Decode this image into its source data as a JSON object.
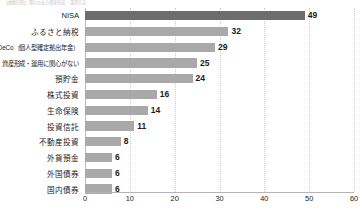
{
  "caption": "【複数回答】関心のある資産形成・運用方法",
  "chart_data": {
    "type": "bar",
    "orientation": "horizontal",
    "title": "",
    "xlabel": "",
    "ylabel": "",
    "xlim": [
      0,
      60
    ],
    "xticks": [
      0,
      10,
      20,
      30,
      40,
      50,
      60
    ],
    "grid": true,
    "legend": false,
    "categories": [
      "NISA",
      "ふるさと納税",
      "iDeCo（個人型確定拠出年金）",
      "資産形成・運用に関心がない",
      "預貯金",
      "株式投資",
      "生命保険",
      "投資信託",
      "不動産投資",
      "外貨預金",
      "外国債券",
      "国内債券"
    ],
    "values": [
      49,
      32,
      29,
      25,
      24,
      16,
      14,
      11,
      8,
      6,
      6,
      6
    ],
    "highlight_index": 0,
    "colors": {
      "bar": "#a9a9a9",
      "bar_highlight": "#6d6d6d",
      "grid": "#cfcfcf",
      "axis": "#b4b4b4",
      "text": "#1b1b1b"
    }
  }
}
